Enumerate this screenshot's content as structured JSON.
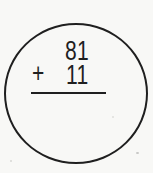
{
  "figure": {
    "shape": "circle",
    "problem": {
      "top_operand": "81",
      "operator": "+",
      "bottom_operand": "11",
      "answer": ""
    }
  },
  "colors": {
    "ink": "#1f1f1f",
    "paper": "#f8f8f6"
  }
}
